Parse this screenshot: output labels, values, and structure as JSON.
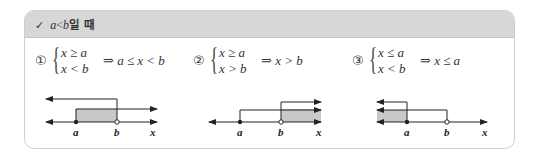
{
  "header": {
    "check_icon": "✓",
    "condition_var_a": "a",
    "condition_op": "<",
    "condition_var_b": "b",
    "condition_suffix": "일 때"
  },
  "cases": [
    {
      "number": "①",
      "line1": "x ≥ a",
      "line2": "x < b",
      "arrow": "⇒",
      "result": "a ≤ x < b"
    },
    {
      "number": "②",
      "line1": "x ≥ a",
      "line2": "x > b",
      "arrow": "⇒",
      "result": "x > b"
    },
    {
      "number": "③",
      "line1": "x ≤ a",
      "line2": "x < b",
      "arrow": "⇒",
      "result": "x ≤ a"
    }
  ],
  "number_lines": {
    "label_a": "a",
    "label_b": "b",
    "label_x": "x"
  },
  "colors": {
    "header_bg": "#d7d7d7",
    "shade": "#c8c8c8",
    "border": "#cfcfcf"
  }
}
